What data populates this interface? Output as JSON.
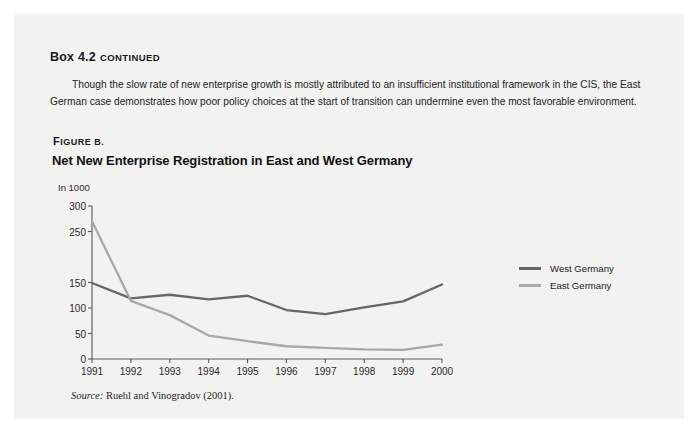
{
  "box": {
    "label_main": "Box 4.2",
    "label_cont": "continued"
  },
  "paragraph": {
    "line1": "Though the slow rate of new enterprise growth is mostly attributed to an insufficient institutional framework in the CIS, the East German case",
    "line2": "demonstrates how poor policy choices at the start of transition can undermine even the most favorable environment."
  },
  "figure": {
    "label": "Figure B.",
    "title": "Net New Enterprise Registration in East and West Germany",
    "unit": "In 1000"
  },
  "source": {
    "label": "Source:",
    "text": "Ruehl and Vinogradov (2001)."
  },
  "legend": {
    "items": [
      {
        "label": "West Germany",
        "color": "#666666"
      },
      {
        "label": "East Germany",
        "color": "#a8a8a8"
      }
    ]
  },
  "chart_data": {
    "type": "line",
    "title": "Net New Enterprise Registration in East and West Germany",
    "xlabel": "",
    "ylabel": "In 1000",
    "ylim": [
      0,
      300
    ],
    "yticks": [
      0,
      50,
      100,
      150,
      200,
      250,
      300
    ],
    "ytick_labels": [
      "0",
      "50",
      "100",
      "",
      "150",
      "250",
      "300"
    ],
    "ytick_labels_visible": [
      "300",
      "250",
      "150",
      "100",
      "50",
      "0"
    ],
    "grid": false,
    "legend_position": "right",
    "categories": [
      "1991",
      "1992",
      "1993",
      "1994",
      "1995",
      "1996",
      "1997",
      "1998",
      "1999",
      "2000"
    ],
    "x": [
      1991,
      1992,
      1993,
      1994,
      1995,
      1996,
      1997,
      1998,
      1999,
      2000
    ],
    "series": [
      {
        "name": "West Germany",
        "color": "#666666",
        "values": [
          149,
          119,
          126,
          117,
          124,
          96,
          88,
          101,
          113,
          146
        ]
      },
      {
        "name": "East Germany",
        "color": "#a8a8a8",
        "values": [
          270,
          114,
          86,
          46,
          35,
          25,
          22,
          19,
          18,
          28
        ]
      }
    ]
  }
}
